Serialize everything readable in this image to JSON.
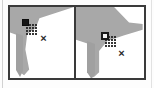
{
  "figure": {
    "panel_count": 2,
    "frame_color": "#3a3a3a",
    "background_color": "#ffffff",
    "region_fill_color": "#a8a8a8"
  },
  "panels": [
    {
      "id": "left",
      "label": "",
      "region_label": "",
      "marker": {
        "style": "solid-square",
        "color": "#171717",
        "x_pct": 22,
        "y_pct": 17
      },
      "stipple": {
        "label": "dotted-halo",
        "x_pct": 27,
        "y_pct": 22
      },
      "cursor": {
        "glyph": "×",
        "label": "x-cursor",
        "x_pct": 44,
        "y_pct": 36
      }
    },
    {
      "id": "right",
      "label": "",
      "region_label": "",
      "marker": {
        "style": "hollow-square",
        "color": "#1a1a1a",
        "x_pct": 40,
        "y_pct": 37
      },
      "stipple": {
        "label": "dotted-halo",
        "x_pct": 46,
        "y_pct": 42
      },
      "cursor": {
        "glyph": "×",
        "label": "x-cursor",
        "x_pct": 58,
        "y_pct": 58
      }
    }
  ],
  "decorations": {
    "left_edge_rule": "vertical-rule",
    "right_edge_rule": "vertical-rule"
  }
}
